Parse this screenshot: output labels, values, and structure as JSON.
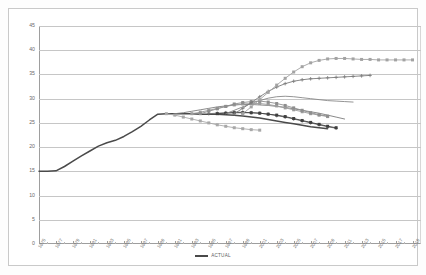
{
  "chart_data": {
    "type": "line",
    "title": "",
    "xlabel": "",
    "ylabel": "",
    "ylim": [
      0,
      45
    ],
    "ytick_values": [
      0,
      5,
      10,
      15,
      20,
      25,
      30,
      35,
      40,
      45
    ],
    "ytick_labels": [
      "0",
      "5",
      "10",
      "15",
      "20",
      "25",
      "30",
      "35",
      "40",
      "45"
    ],
    "xlim": [
      1975,
      2020
    ],
    "xtick_labels": [
      "1975",
      "1977",
      "1979",
      "1981",
      "1983",
      "1985",
      "1987",
      "1989",
      "1991",
      "1993",
      "1995",
      "1997",
      "1999",
      "2001",
      "2003",
      "2005",
      "2007",
      "2009",
      "2011",
      "2013",
      "2015",
      "2017",
      "2019"
    ],
    "grid": "horizontal",
    "legend_position": "bottom-center",
    "legend": [
      "ACTUAL"
    ],
    "series": [
      {
        "name": "ACTUAL",
        "color": "#4a4a4a",
        "marker": "none",
        "x": [
          1975,
          1976,
          1977,
          1978,
          1979,
          1980,
          1981,
          1982,
          1983,
          1984,
          1985,
          1986,
          1987,
          1988,
          1989,
          1990,
          1991,
          1992,
          1993,
          1994,
          1995,
          1996,
          1997,
          1998,
          1999,
          2000,
          2001,
          2002,
          2003,
          2004,
          2005,
          2006,
          2007,
          2008,
          2009
        ],
        "values": [
          15.0,
          15.0,
          15.1,
          16.0,
          17.1,
          18.2,
          19.2,
          20.2,
          20.9,
          21.4,
          22.2,
          23.2,
          24.3,
          25.6,
          26.8,
          26.9,
          26.9,
          26.9,
          26.9,
          26.8,
          26.8,
          26.8,
          26.7,
          26.6,
          26.4,
          26.2,
          26.0,
          25.7,
          25.4,
          25.1,
          24.8,
          24.5,
          24.2,
          24.0,
          23.8
        ]
      },
      {
        "name": "Projection 1990",
        "color": "#a8a8a8",
        "marker": "square",
        "x": [
          1990,
          1991,
          1992,
          1993,
          1994,
          1995,
          1996,
          1997,
          1998,
          1999,
          2000,
          2001
        ],
        "values": [
          26.9,
          26.6,
          26.2,
          25.8,
          25.4,
          25.0,
          24.6,
          24.3,
          24.0,
          23.8,
          23.6,
          23.5
        ]
      },
      {
        "name": "Projection 1991",
        "color": "#7d7d7d",
        "marker": "none",
        "x": [
          1991,
          1992,
          1993,
          1994,
          1995,
          1996,
          1997,
          1998,
          1999,
          2000,
          2001,
          2002,
          2003,
          2004,
          2005,
          2006,
          2007,
          2008,
          2009,
          2010,
          2011
        ],
        "values": [
          26.9,
          27.1,
          27.4,
          27.7,
          28.0,
          28.3,
          28.5,
          28.7,
          28.8,
          28.8,
          28.7,
          28.6,
          28.4,
          28.2,
          27.9,
          27.6,
          27.3,
          27.0,
          26.6,
          26.2,
          25.8
        ]
      },
      {
        "name": "Projection 1993",
        "color": "#9b9b9b",
        "marker": "square",
        "x": [
          1993,
          1994,
          1995,
          1996,
          1997,
          1998,
          1999,
          2000,
          2001,
          2002,
          2003,
          2004,
          2005,
          2006,
          2007,
          2008,
          2009
        ],
        "values": [
          26.9,
          27.2,
          27.6,
          28.0,
          28.4,
          28.7,
          28.9,
          29.0,
          29.0,
          28.8,
          28.5,
          28.1,
          27.7,
          27.3,
          26.9,
          26.6,
          26.3
        ]
      },
      {
        "name": "Projection 1994",
        "color": "#8e8e8e",
        "marker": "square",
        "x": [
          1994,
          1995,
          1996,
          1997,
          1998,
          1999,
          2000,
          2001,
          2002,
          2003,
          2004,
          2005,
          2006,
          2007,
          2008,
          2009
        ],
        "values": [
          26.9,
          27.4,
          27.9,
          28.4,
          28.9,
          29.2,
          29.4,
          29.5,
          29.3,
          29.0,
          28.6,
          28.1,
          27.6,
          27.1,
          26.7,
          26.4
        ]
      },
      {
        "name": "Projection 1995",
        "color": "#6f6f6f",
        "marker": "cross",
        "x": [
          1995,
          1996,
          1997,
          1998,
          1999,
          2000,
          2001,
          2002,
          2003,
          2004,
          2005,
          2006,
          2007,
          2008,
          2009,
          2010
        ],
        "values": [
          26.9,
          27.0,
          27.1,
          27.2,
          27.2,
          27.1,
          27.0,
          26.8,
          26.5,
          26.2,
          25.8,
          25.4,
          25.0,
          24.6,
          24.2,
          23.9
        ]
      },
      {
        "name": "Projection 1996",
        "color": "#3f3f3f",
        "marker": "square",
        "x": [
          1996,
          1997,
          1998,
          1999,
          2000,
          2001,
          2002,
          2003,
          2004,
          2005,
          2006,
          2007,
          2008,
          2009,
          2010
        ],
        "values": [
          26.9,
          27.0,
          27.1,
          27.1,
          27.1,
          27.0,
          26.8,
          26.6,
          26.3,
          25.9,
          25.5,
          25.1,
          24.7,
          24.3,
          24.0
        ]
      },
      {
        "name": "Projection 1997",
        "color": "#888888",
        "marker": "none",
        "x": [
          1997,
          1998,
          1999,
          2000,
          2001,
          2002,
          2003,
          2004,
          2005,
          2006,
          2007,
          2008,
          2009,
          2010,
          2011,
          2012
        ],
        "values": [
          26.9,
          27.6,
          28.3,
          29.0,
          29.6,
          30.1,
          30.4,
          30.5,
          30.4,
          30.2,
          30.0,
          29.8,
          29.6,
          29.5,
          29.4,
          29.3
        ]
      },
      {
        "name": "Projection 1998",
        "color": "#7a7a7a",
        "marker": "cross",
        "x": [
          1998,
          1999,
          2000,
          2001,
          2002,
          2003,
          2004,
          2005,
          2006,
          2007,
          2008,
          2009,
          2010,
          2011,
          2012,
          2013,
          2014
        ],
        "values": [
          26.9,
          28.0,
          29.2,
          30.4,
          31.5,
          32.4,
          33.1,
          33.6,
          33.9,
          34.1,
          34.2,
          34.3,
          34.4,
          34.5,
          34.6,
          34.7,
          34.8
        ]
      },
      {
        "name": "Projection 1999",
        "color": "#a3a3a3",
        "marker": "square",
        "x": [
          1999,
          2000,
          2001,
          2002,
          2003,
          2004,
          2005,
          2006,
          2007,
          2008,
          2009,
          2010,
          2011,
          2012,
          2013,
          2014,
          2015,
          2016,
          2017,
          2018,
          2019
        ],
        "values": [
          26.9,
          28.3,
          29.8,
          31.3,
          32.8,
          34.2,
          35.5,
          36.6,
          37.4,
          37.9,
          38.2,
          38.3,
          38.3,
          38.2,
          38.1,
          38.1,
          38.0,
          38.0,
          38.0,
          38.0,
          38.0
        ]
      }
    ]
  },
  "legend": {
    "actual_label": "ACTUAL"
  }
}
